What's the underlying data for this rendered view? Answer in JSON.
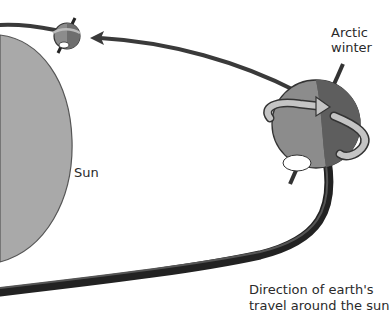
{
  "diagram": {
    "type": "illustration",
    "labels": {
      "sun": "Sun",
      "arctic_line1": "Arctic",
      "arctic_line2": "winter",
      "direction_line1": "Direction of earth's",
      "direction_line2": "travel around the sun"
    },
    "elements": [
      "sun",
      "orbit-path",
      "earth-small-distant",
      "earth-large-near",
      "rotation-arrow",
      "axis"
    ],
    "colors": {
      "background": "#ffffff",
      "sun_fill": "#a9a9a9",
      "sun_stroke": "#555555",
      "orbit": "#333333",
      "earth_light": "#8c8c8c",
      "earth_dark": "#5e5e5e",
      "arrow_band": "#bdbdbd",
      "text": "#2a2a2a"
    }
  }
}
